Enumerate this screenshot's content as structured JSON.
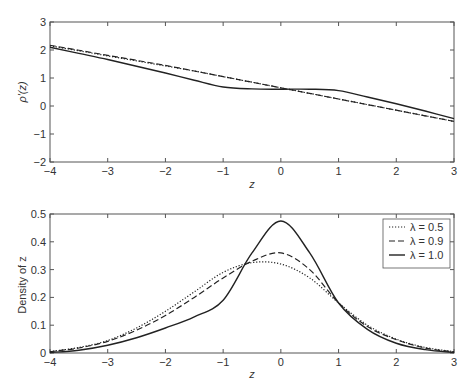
{
  "chart_data": [
    {
      "type": "line",
      "title": "",
      "xlabel": "z",
      "ylabel": "ρ'(z)",
      "xlim": [
        -4,
        3
      ],
      "ylim": [
        -2,
        3
      ],
      "xticks": [
        "-4",
        "-3",
        "-2",
        "-1",
        "0",
        "1",
        "2",
        "3"
      ],
      "yticks": [
        "-2",
        "-1",
        "0",
        "1",
        "2",
        "3"
      ],
      "grid": false,
      "x": [
        -4,
        -3.5,
        -3,
        -2.5,
        -2,
        -1.5,
        -1,
        -0.5,
        0,
        0.5,
        1,
        1.5,
        2,
        2.5,
        3
      ],
      "series": [
        {
          "name": "λ = 0.5",
          "style": "dotted",
          "values": [
            2.15,
            1.97,
            1.79,
            1.61,
            1.43,
            1.25,
            1.05,
            0.85,
            0.65,
            0.45,
            0.25,
            0.05,
            -0.15,
            -0.35,
            -0.55
          ]
        },
        {
          "name": "λ = 0.9",
          "style": "dashed",
          "values": [
            2.17,
            1.99,
            1.81,
            1.63,
            1.45,
            1.25,
            1.05,
            0.85,
            0.65,
            0.45,
            0.25,
            0.05,
            -0.15,
            -0.35,
            -0.55
          ]
        },
        {
          "name": "λ = 1.0",
          "style": "solid",
          "values": [
            2.1,
            1.88,
            1.66,
            1.42,
            1.18,
            0.92,
            0.68,
            0.61,
            0.6,
            0.6,
            0.55,
            0.32,
            0.08,
            -0.18,
            -0.45
          ]
        }
      ]
    },
    {
      "type": "line",
      "title": "",
      "xlabel": "z",
      "ylabel": "Density of z",
      "xlim": [
        -4,
        3
      ],
      "ylim": [
        0,
        0.5
      ],
      "xticks": [
        "-4",
        "-3",
        "-2",
        "-1",
        "0",
        "1",
        "2",
        "3"
      ],
      "yticks": [
        "0",
        "0.1",
        "0.2",
        "0.3",
        "0.4",
        "0.5"
      ],
      "grid": false,
      "legend_position": "upper right",
      "x": [
        -4,
        -3.5,
        -3,
        -2.5,
        -2,
        -1.5,
        -1,
        -0.5,
        0,
        0.5,
        1,
        1.5,
        2,
        2.5,
        3
      ],
      "series": [
        {
          "name": "λ = 0.5",
          "style": "dotted",
          "values": [
            0.005,
            0.02,
            0.045,
            0.09,
            0.15,
            0.22,
            0.29,
            0.325,
            0.32,
            0.27,
            0.18,
            0.1,
            0.05,
            0.02,
            0.005
          ]
        },
        {
          "name": "λ = 0.9",
          "style": "dashed",
          "values": [
            0.005,
            0.018,
            0.042,
            0.082,
            0.135,
            0.2,
            0.27,
            0.33,
            0.36,
            0.3,
            0.18,
            0.095,
            0.048,
            0.018,
            0.004
          ]
        },
        {
          "name": "λ = 1.0",
          "style": "solid",
          "values": [
            0.002,
            0.01,
            0.028,
            0.055,
            0.09,
            0.13,
            0.19,
            0.36,
            0.475,
            0.36,
            0.18,
            0.085,
            0.035,
            0.012,
            0.002
          ]
        }
      ]
    }
  ],
  "legend": {
    "items": [
      {
        "label": "λ = 0.5",
        "style": "dotted"
      },
      {
        "label": "λ = 0.9",
        "style": "dashed"
      },
      {
        "label": "λ = 1.0",
        "style": "solid"
      }
    ]
  },
  "top_plot": {
    "xlabel": "z",
    "ylabel": "ρ'(z)",
    "xticks": [
      "−4",
      "−3",
      "−2",
      "−1",
      "0",
      "1",
      "2",
      "3"
    ],
    "yticks": [
      "−2",
      "−1",
      "0",
      "1",
      "2",
      "3"
    ]
  },
  "bottom_plot": {
    "xlabel": "z",
    "ylabel": "Density of z",
    "xticks": [
      "−4",
      "−3",
      "−2",
      "−1",
      "0",
      "1",
      "2",
      "3"
    ],
    "yticks": [
      "0",
      "0.1",
      "0.2",
      "0.3",
      "0.4",
      "0.5"
    ]
  }
}
